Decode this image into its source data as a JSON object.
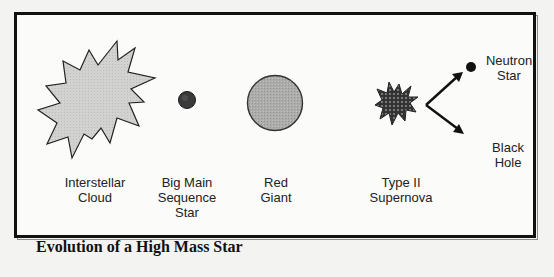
{
  "diagram": {
    "title": "Evolution of a High Mass Star",
    "stages": [
      {
        "id": "interstellar-cloud",
        "label": "Interstellar\nCloud",
        "icon": "starburst-cloud-icon"
      },
      {
        "id": "big-main-sequence-star",
        "label": "Big Main\nSequence\nStar",
        "icon": "small-dark-star-icon"
      },
      {
        "id": "red-giant",
        "label": "Red\nGiant",
        "icon": "large-gray-sphere-icon"
      },
      {
        "id": "type-ii-supernova",
        "label": "Type II\nSupernova",
        "icon": "supernova-burst-icon"
      }
    ],
    "outcomes": [
      {
        "id": "neutron-star",
        "label": "Neutron\nStar",
        "icon": "neutron-dot-icon"
      },
      {
        "id": "black-hole",
        "label": "Black\nHole",
        "icon": "arrow-down-right-icon"
      }
    ],
    "colors": {
      "cloud_fill": "#d4d4d2",
      "main_sequence_fill": "#3a3a3a",
      "red_giant_fill": "#a9a9a7",
      "supernova_fill": "#3c3c3c",
      "stroke": "#1a1a1a"
    }
  }
}
